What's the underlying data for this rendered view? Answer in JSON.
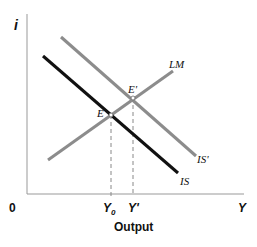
{
  "diagram": {
    "type": "IS-LM",
    "axes": {
      "y_label": "i",
      "x_label": "Y",
      "origin_label": "0",
      "x_title": "Output"
    },
    "curves": [
      {
        "name": "IS",
        "label": "IS",
        "color": "#111111",
        "from": [
          43,
          56
        ],
        "to": [
          178,
          173
        ]
      },
      {
        "name": "IS'",
        "label": "IS'",
        "color": "#8c8c8c",
        "from": [
          61,
          37
        ],
        "to": [
          196,
          156
        ]
      },
      {
        "name": "LM",
        "label": "LM",
        "color": "#8c8c8c",
        "from": [
          48,
          160
        ],
        "to": [
          173,
          71
        ]
      }
    ],
    "points": [
      {
        "label": "E",
        "at": [
          111,
          115
        ]
      },
      {
        "label": "E'",
        "at": [
          133,
          98
        ]
      }
    ],
    "ticks": [
      {
        "label": "Y",
        "sub": "0",
        "x": 111
      },
      {
        "label": "Y'",
        "x": 133
      }
    ]
  }
}
